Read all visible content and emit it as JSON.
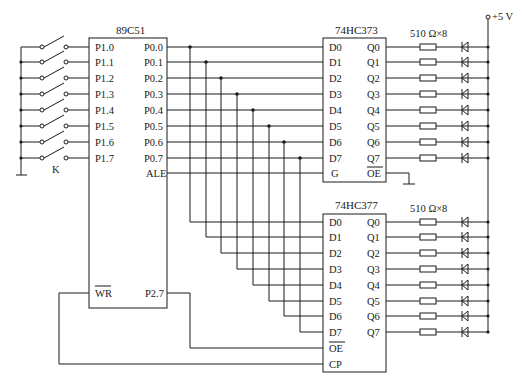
{
  "mcu": {
    "title": "89C51",
    "left_pins": [
      "P1.0",
      "P1.1",
      "P1.2",
      "P1.3",
      "P1.4",
      "P1.5",
      "P1.6",
      "P1.7"
    ],
    "right_pins": [
      "P0.0",
      "P0.1",
      "P0.2",
      "P0.3",
      "P0.4",
      "P0.5",
      "P0.6",
      "P0.7",
      "ALE"
    ],
    "wr_label": "WR",
    "p27_label": "P2.7"
  },
  "switches": {
    "label": "K"
  },
  "latch373": {
    "title": "74HC373",
    "d_pins": [
      "D0",
      "D1",
      "D2",
      "D3",
      "D4",
      "D5",
      "D6",
      "D7"
    ],
    "q_pins": [
      "Q0",
      "Q1",
      "Q2",
      "Q3",
      "Q4",
      "Q5",
      "Q6",
      "Q7"
    ],
    "g_label": "G",
    "oe_label": "OE",
    "resistor_label": "510 Ω×8"
  },
  "latch377": {
    "title": "74HC377",
    "d_pins": [
      "D0",
      "D1",
      "D2",
      "D3",
      "D4",
      "D5",
      "D6",
      "D7"
    ],
    "q_pins": [
      "Q0",
      "Q1",
      "Q2",
      "Q3",
      "Q4",
      "Q5",
      "Q6",
      "Q7"
    ],
    "oe_label": "OE",
    "cp_label": "CP",
    "resistor_label": "510 Ω×8"
  },
  "power": {
    "label": "+5 V"
  }
}
